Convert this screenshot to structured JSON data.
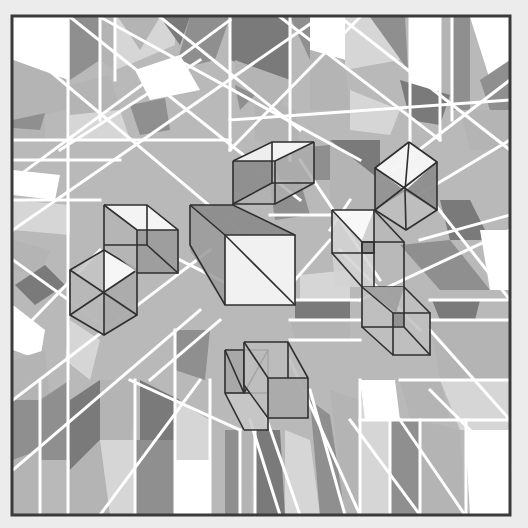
{
  "artwork": {
    "background": "#ececec",
    "canvas_fill": "#b9b9b9",
    "frame": {
      "x": 12,
      "y": 16,
      "width": 498,
      "height": 499,
      "stroke": "#3a3a3a"
    },
    "palette": {
      "white": "#ffffff",
      "light": "#d6d6d6",
      "mid": "#b4b4b4",
      "dark": "#8f8f8f",
      "darker": "#7a7a7a"
    },
    "tiles": [
      {
        "points": "13,17 68,17 68,80 13,60",
        "fill": "#ffffff"
      },
      {
        "points": "13,60 68,80 68,110 13,120",
        "fill": "#b4b4b4"
      },
      {
        "points": "13,120 45,110 45,140 13,140",
        "fill": "#b4b4b4"
      },
      {
        "points": "13,120 45,113 40,130 13,128",
        "fill": "#8f8f8f"
      },
      {
        "points": "70,17 100,17 100,60 70,80",
        "fill": "#8f8f8f"
      },
      {
        "points": "100,17 115,17 115,70 100,60",
        "fill": "#b4b4b4"
      },
      {
        "points": "115,17 175,17 175,45 140,60 115,70",
        "fill": "#d6d6d6"
      },
      {
        "points": "118,17 160,17 140,50",
        "fill": "#b4b4b4"
      },
      {
        "points": "160,17 190,17 180,45",
        "fill": "#7a7a7a"
      },
      {
        "points": "190,17 230,17 215,60 175,70",
        "fill": "#8f8f8f"
      },
      {
        "points": "135,70 180,55 200,90 150,100",
        "fill": "#ffffff"
      },
      {
        "points": "70,85 110,75 120,110 70,115",
        "fill": "#b4b4b4"
      },
      {
        "points": "70,115 120,110 130,140 70,140",
        "fill": "#d6d6d6"
      },
      {
        "points": "130,105 165,98 170,130 140,135",
        "fill": "#8f8f8f"
      },
      {
        "points": "230,17 290,17 290,80 230,60",
        "fill": "#7a7a7a"
      },
      {
        "points": "235,60 290,80 280,110 235,100",
        "fill": "#b4b4b4"
      },
      {
        "points": "235,85 255,95 240,110",
        "fill": "#8f8f8f"
      },
      {
        "points": "255,95 295,110 300,150 255,140",
        "fill": "#b4b4b4"
      },
      {
        "points": "290,17 310,17 310,60",
        "fill": "#8f8f8f"
      },
      {
        "points": "310,17 350,17 345,60 310,50",
        "fill": "#ffffff"
      },
      {
        "points": "310,50 345,60 350,110 310,110",
        "fill": "#b4b4b4"
      },
      {
        "points": "345,17 400,17 400,60 345,70",
        "fill": "#d6d6d6"
      },
      {
        "points": "370,17 405,17 408,70",
        "fill": "#8f8f8f"
      },
      {
        "points": "410,17 440,17 440,90 420,100 410,90",
        "fill": "#ffffff"
      },
      {
        "points": "440,17 452,17 452,110 440,110",
        "fill": "#b4b4b4"
      },
      {
        "points": "452,17 470,17 470,110 452,110",
        "fill": "#8f8f8f"
      },
      {
        "points": "470,17 510,17 510,80 490,80",
        "fill": "#ffffff"
      },
      {
        "points": "480,80 510,60 510,110 490,110",
        "fill": "#8f8f8f"
      },
      {
        "points": "400,80 450,95 440,125 410,120",
        "fill": "#7a7a7a"
      },
      {
        "points": "460,110 510,110 510,150 470,150",
        "fill": "#b4b4b4"
      },
      {
        "points": "350,90 400,110 390,135 350,130",
        "fill": "#d6d6d6"
      },
      {
        "points": "270,150 330,145 330,180 280,180",
        "fill": "#8f8f8f"
      },
      {
        "points": "330,140 380,140 380,180 330,180",
        "fill": "#7a7a7a"
      },
      {
        "points": "13,170 60,175 55,200 13,195",
        "fill": "#ffffff"
      },
      {
        "points": "13,200 70,205 70,235 13,230",
        "fill": "#d6d6d6"
      },
      {
        "points": "13,240 50,250 40,275 13,270",
        "fill": "#b4b4b4"
      },
      {
        "points": "15,285 45,265 65,285 35,305",
        "fill": "#7a7a7a"
      },
      {
        "points": "13,305 45,330 40,360 13,350",
        "fill": "#ffffff"
      },
      {
        "points": "13,360 45,350 50,400 13,400",
        "fill": "#b4b4b4"
      },
      {
        "points": "13,400 40,400 40,450 13,460",
        "fill": "#8f8f8f"
      },
      {
        "points": "13,460 40,450 40,515 13,515",
        "fill": "#b4b4b4"
      },
      {
        "points": "70,320 100,340 90,380 65,360",
        "fill": "#d6d6d6"
      },
      {
        "points": "40,400 70,380 70,460 40,460",
        "fill": "#8f8f8f"
      },
      {
        "points": "70,400 100,380 100,440 70,470",
        "fill": "#7a7a7a"
      },
      {
        "points": "100,380 140,380 130,440 100,440",
        "fill": "#b4b4b4"
      },
      {
        "points": "70,470 100,440 110,515 70,515",
        "fill": "#b4b4b4"
      },
      {
        "points": "100,440 135,440 135,515 110,515",
        "fill": "#d6d6d6"
      },
      {
        "points": "140,380 180,400 175,440 140,440",
        "fill": "#7a7a7a"
      },
      {
        "points": "135,440 175,440 175,515 135,515",
        "fill": "#8f8f8f"
      },
      {
        "points": "175,400 210,420 210,460 175,460",
        "fill": "#d6d6d6"
      },
      {
        "points": "175,460 210,460 210,515 175,515",
        "fill": "#ffffff"
      },
      {
        "points": "175,330 210,330 205,380 175,370",
        "fill": "#8f8f8f"
      },
      {
        "points": "225,430 240,430 240,515 225,515",
        "fill": "#8f8f8f"
      },
      {
        "points": "240,430 255,430 250,515 240,515",
        "fill": "#b4b4b4"
      },
      {
        "points": "255,430 280,430 285,515 255,515",
        "fill": "#7a7a7a"
      },
      {
        "points": "285,430 310,440 320,515 285,515",
        "fill": "#d6d6d6"
      },
      {
        "points": "310,400 330,415 345,515 320,515",
        "fill": "#8f8f8f"
      },
      {
        "points": "330,390 360,400 360,515 345,515",
        "fill": "#b4b4b4"
      },
      {
        "points": "360,400 390,420 390,515 360,515",
        "fill": "#d6d6d6"
      },
      {
        "points": "360,380 395,380 400,420 365,420",
        "fill": "#ffffff"
      },
      {
        "points": "390,420 420,420 420,515 390,515",
        "fill": "#8f8f8f"
      },
      {
        "points": "400,380 440,380 450,420 410,420",
        "fill": "#b4b4b4"
      },
      {
        "points": "420,420 460,430 465,515 420,515",
        "fill": "#b4b4b4"
      },
      {
        "points": "440,380 510,380 510,430 460,430",
        "fill": "#d6d6d6"
      },
      {
        "points": "465,430 510,430 510,515 470,515",
        "fill": "#ffffff"
      },
      {
        "points": "432,300 480,300 475,320 440,320",
        "fill": "#7a7a7a"
      },
      {
        "points": "400,245 450,240 490,290 440,290",
        "fill": "#8f8f8f"
      },
      {
        "points": "440,200 470,200 490,240 450,240",
        "fill": "#7a7a7a"
      },
      {
        "points": "480,230 510,230 510,290 490,290",
        "fill": "#ffffff"
      },
      {
        "points": "430,320 510,320 510,380 440,380",
        "fill": "#b4b4b4"
      },
      {
        "points": "295,300 350,300 350,320 295,320",
        "fill": "#7a7a7a"
      },
      {
        "points": "290,320 350,320 350,340 295,340",
        "fill": "#b4b4b4"
      },
      {
        "points": "300,275 350,270 350,300 300,300",
        "fill": "#d6d6d6"
      },
      {
        "points": "330,140 380,180 380,220 330,210",
        "fill": "#b4b4b4"
      },
      {
        "points": "270,185 300,180 310,215 275,220",
        "fill": "#8f8f8f"
      }
    ],
    "white_lines": [
      {
        "x1": 68,
        "y1": 17,
        "x2": 68,
        "y2": 515
      },
      {
        "x1": 40,
        "y1": 380,
        "x2": 40,
        "y2": 515
      },
      {
        "x1": 100,
        "y1": 17,
        "x2": 100,
        "y2": 120
      },
      {
        "x1": 115,
        "y1": 17,
        "x2": 115,
        "y2": 80
      },
      {
        "x1": 135,
        "y1": 380,
        "x2": 135,
        "y2": 515
      },
      {
        "x1": 175,
        "y1": 330,
        "x2": 175,
        "y2": 515
      },
      {
        "x1": 210,
        "y1": 380,
        "x2": 210,
        "y2": 515
      },
      {
        "x1": 230,
        "y1": 17,
        "x2": 230,
        "y2": 150
      },
      {
        "x1": 290,
        "y1": 17,
        "x2": 290,
        "y2": 160
      },
      {
        "x1": 240,
        "y1": 430,
        "x2": 240,
        "y2": 515
      },
      {
        "x1": 255,
        "y1": 430,
        "x2": 255,
        "y2": 515
      },
      {
        "x1": 360,
        "y1": 380,
        "x2": 360,
        "y2": 515
      },
      {
        "x1": 390,
        "y1": 420,
        "x2": 390,
        "y2": 515
      },
      {
        "x1": 410,
        "y1": 17,
        "x2": 410,
        "y2": 160
      },
      {
        "x1": 440,
        "y1": 17,
        "x2": 440,
        "y2": 140
      },
      {
        "x1": 452,
        "y1": 17,
        "x2": 452,
        "y2": 120
      },
      {
        "x1": 420,
        "y1": 420,
        "x2": 420,
        "y2": 515
      },
      {
        "x1": 466,
        "y1": 420,
        "x2": 466,
        "y2": 515
      },
      {
        "x1": 13,
        "y1": 140,
        "x2": 230,
        "y2": 140
      },
      {
        "x1": 13,
        "y1": 160,
        "x2": 120,
        "y2": 160
      },
      {
        "x1": 13,
        "y1": 200,
        "x2": 100,
        "y2": 200
      },
      {
        "x1": 230,
        "y1": 120,
        "x2": 510,
        "y2": 100
      },
      {
        "x1": 270,
        "y1": 215,
        "x2": 330,
        "y2": 215
      },
      {
        "x1": 290,
        "y1": 300,
        "x2": 360,
        "y2": 300
      },
      {
        "x1": 290,
        "y1": 320,
        "x2": 360,
        "y2": 320
      },
      {
        "x1": 290,
        "y1": 340,
        "x2": 360,
        "y2": 340
      },
      {
        "x1": 400,
        "y1": 380,
        "x2": 510,
        "y2": 380
      },
      {
        "x1": 360,
        "y1": 420,
        "x2": 510,
        "y2": 420
      },
      {
        "x1": 430,
        "y1": 320,
        "x2": 510,
        "y2": 320
      },
      {
        "x1": 430,
        "y1": 300,
        "x2": 510,
        "y2": 300
      },
      {
        "x1": 13,
        "y1": 40,
        "x2": 250,
        "y2": 240
      },
      {
        "x1": 70,
        "y1": 17,
        "x2": 300,
        "y2": 200
      },
      {
        "x1": 100,
        "y1": 17,
        "x2": 360,
        "y2": 160
      },
      {
        "x1": 160,
        "y1": 17,
        "x2": 300,
        "y2": 130
      },
      {
        "x1": 13,
        "y1": 180,
        "x2": 230,
        "y2": 20
      },
      {
        "x1": 13,
        "y1": 230,
        "x2": 320,
        "y2": 17
      },
      {
        "x1": 60,
        "y1": 150,
        "x2": 200,
        "y2": 60
      },
      {
        "x1": 230,
        "y1": 150,
        "x2": 360,
        "y2": 17
      },
      {
        "x1": 280,
        "y1": 17,
        "x2": 440,
        "y2": 140
      },
      {
        "x1": 340,
        "y1": 17,
        "x2": 510,
        "y2": 150
      },
      {
        "x1": 380,
        "y1": 180,
        "x2": 510,
        "y2": 80
      },
      {
        "x1": 410,
        "y1": 200,
        "x2": 510,
        "y2": 140
      },
      {
        "x1": 400,
        "y1": 160,
        "x2": 510,
        "y2": 300
      },
      {
        "x1": 420,
        "y1": 240,
        "x2": 510,
        "y2": 215
      },
      {
        "x1": 360,
        "y1": 300,
        "x2": 510,
        "y2": 230
      },
      {
        "x1": 13,
        "y1": 260,
        "x2": 110,
        "y2": 330
      },
      {
        "x1": 13,
        "y1": 340,
        "x2": 100,
        "y2": 250
      },
      {
        "x1": 13,
        "y1": 400,
        "x2": 210,
        "y2": 250
      },
      {
        "x1": 13,
        "y1": 470,
        "x2": 200,
        "y2": 310
      },
      {
        "x1": 100,
        "y1": 515,
        "x2": 200,
        "y2": 380
      },
      {
        "x1": 150,
        "y1": 380,
        "x2": 220,
        "y2": 320
      },
      {
        "x1": 130,
        "y1": 380,
        "x2": 240,
        "y2": 430
      },
      {
        "x1": 180,
        "y1": 260,
        "x2": 260,
        "y2": 300
      },
      {
        "x1": 250,
        "y1": 420,
        "x2": 280,
        "y2": 515
      },
      {
        "x1": 260,
        "y1": 400,
        "x2": 300,
        "y2": 515
      },
      {
        "x1": 290,
        "y1": 360,
        "x2": 360,
        "y2": 515
      },
      {
        "x1": 310,
        "y1": 390,
        "x2": 345,
        "y2": 515
      },
      {
        "x1": 350,
        "y1": 420,
        "x2": 420,
        "y2": 515
      },
      {
        "x1": 400,
        "y1": 420,
        "x2": 465,
        "y2": 515
      },
      {
        "x1": 430,
        "y1": 330,
        "x2": 510,
        "y2": 420
      },
      {
        "x1": 430,
        "y1": 390,
        "x2": 510,
        "y2": 470
      },
      {
        "x1": 300,
        "y1": 160,
        "x2": 380,
        "y2": 280
      },
      {
        "x1": 340,
        "y1": 250,
        "x2": 420,
        "y2": 330
      },
      {
        "x1": 295,
        "y1": 280,
        "x2": 330,
        "y2": 240
      },
      {
        "x1": 330,
        "y1": 230,
        "x2": 350,
        "y2": 200
      }
    ],
    "cubes": [
      {
        "name": "cube-top-center",
        "faces": [
          {
            "points": "233,161 272,142 314,142 314,183 275,204 233,204",
            "fill": "#b0b0b0"
          },
          {
            "points": "233,161 272,142 272,183 233,204",
            "fill": "#8a8a8a"
          },
          {
            "points": "233,161 272,142 314,142 275,161",
            "fill": "#ffffff"
          }
        ],
        "edges": [
          "233,161 275,161 314,142",
          "233,161 272,142 314,142",
          "275,161 275,204",
          "233,161 233,204 275,204 314,183 314,142",
          "272,142 272,183 233,204",
          "272,183 314,183"
        ]
      },
      {
        "name": "cube-center-large",
        "faces": [
          {
            "points": "190,205 233,205 295,235 295,305 225,305 190,250",
            "fill": "#9a9a9a"
          },
          {
            "points": "225,235 295,235 295,305 225,305",
            "fill": "#ffffff"
          },
          {
            "points": "190,205 233,205 295,235 225,235",
            "fill": "#8c8c8c"
          }
        ],
        "edges": [
          "190,205 233,205 295,235 295,305 225,305 190,245 190,205",
          "190,205 225,235 225,305",
          "225,235 295,235",
          "225,235 295,305"
        ]
      },
      {
        "name": "cube-left-hex",
        "faces": [
          {
            "points": "104,250 137,270 137,315 104,335 70,315 70,270",
            "fill": "#c4c4c4"
          },
          {
            "points": "104,250 137,270 104,293",
            "fill": "#ffffff"
          },
          {
            "points": "70,270 104,293 104,335 70,315",
            "fill": "#b6b6b6"
          },
          {
            "points": "104,293 137,270 137,315 104,335",
            "fill": "#a8a8a8"
          }
        ],
        "edges": [
          "104,250 137,270 137,315 104,335 70,315 70,270 104,250",
          "104,250 104,335",
          "70,270 137,315",
          "137,270 70,315"
        ]
      },
      {
        "name": "cube-left-upper",
        "faces": [
          {
            "points": "104,205 147,205 178,230 178,273 137,273 104,245",
            "fill": "#b4b4b4"
          },
          {
            "points": "104,205 147,205 178,230 137,230",
            "fill": "#ffffff"
          },
          {
            "points": "137,230 178,230 178,273 137,273",
            "fill": "#9a9a9a"
          }
        ],
        "edges": [
          "104,205 147,205 178,230 178,273 137,273",
          "104,205 137,230 178,230",
          "137,230 137,273",
          "147,205 147,245 104,245",
          "147,245 178,273",
          "104,205 104,250"
        ]
      },
      {
        "name": "cube-right-top",
        "faces": [
          {
            "points": "409,142 437,162 437,210 406,230 375,210 375,168",
            "fill": "#b4b4b4"
          },
          {
            "points": "409,142 437,162 405,191 375,168",
            "fill": "#ffffff"
          },
          {
            "points": "405,191 437,210 406,230 375,210",
            "fill": "#c0c0c0"
          },
          {
            "points": "405,191 437,162 437,210",
            "fill": "#8a8a8a"
          },
          {
            "points": "375,168 405,191 375,210",
            "fill": "#8f8f8f"
          }
        ],
        "edges": [
          "409,142 437,162 437,210 406,230 375,210 375,168 409,142",
          "409,142 405,191 406,230",
          "375,168 437,210",
          "437,162 375,210"
        ]
      },
      {
        "name": "cube-right-middle",
        "faces": [
          {
            "points": "332,210 374,210 374,287 335,287 332,250",
            "fill": "#d4d4d4"
          },
          {
            "points": "332,210 374,210 362,240",
            "fill": "#ffffff"
          },
          {
            "points": "362,242 374,242 374,253 362,253",
            "fill": "#8a8a8a"
          }
        ],
        "edges": [
          "332,210 374,210 374,287",
          "332,210 332,253 374,253",
          "362,242 404,242 404,287",
          "332,210 362,242 362,287 404,287",
          "332,253 362,287",
          "374,210 404,242",
          "362,242 362,253 374,253 374,242 362,242"
        ]
      },
      {
        "name": "cube-right-lower",
        "faces": [
          {
            "points": "362,287 404,287 430,313 430,355 393,355 362,327",
            "fill": "#c0c0c0"
          },
          {
            "points": "362,287 404,287 396,313",
            "fill": "#9c9c9c"
          },
          {
            "points": "393,313 404,313 404,326 393,326",
            "fill": "#8a8a8a"
          }
        ],
        "edges": [
          "362,287 362,327 404,327 404,287",
          "393,313 430,313 430,355 393,355 393,313",
          "362,287 393,313",
          "404,287 430,313",
          "362,327 393,355",
          "404,327 430,355"
        ]
      },
      {
        "name": "cube-bottom-center-a",
        "faces": [
          {
            "points": "225,350 244,350 268,384 268,430 244,430 225,393",
            "fill": "#c8c8c8"
          },
          {
            "points": "225,350 244,350 244,393 225,393",
            "fill": "#a2a2a2"
          }
        ],
        "edges": [
          "225,350 268,350 268,430 244,430",
          "225,350 225,393 244,430",
          "244,350 244,393 268,393",
          "225,393 244,393",
          "268,350 244,393",
          "225,350 244,393"
        ]
      },
      {
        "name": "cube-bottom-center-b",
        "faces": [
          {
            "points": "244,342 288,342 308,378 308,418 268,418 244,385",
            "fill": "#bcbcbc"
          },
          {
            "points": "268,378 308,378 308,418 268,418",
            "fill": "#a8a8a8"
          }
        ],
        "edges": [
          "244,342 288,342 308,378 308,418 268,418",
          "244,342 268,378 308,378",
          "268,378 268,418",
          "288,342 288,378",
          "244,342 244,385 268,418"
        ]
      }
    ]
  }
}
